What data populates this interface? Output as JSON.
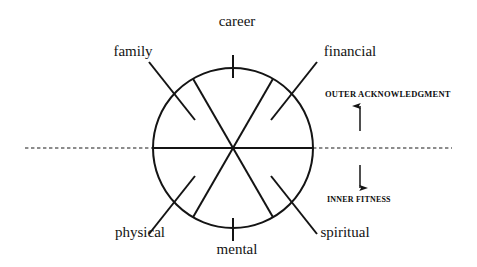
{
  "diagram": {
    "type": "radial-wheel",
    "stroke_color": "#141414",
    "background_color": "#ffffff",
    "circle": {
      "center_x": 233,
      "center_y": 148,
      "radius": 80
    },
    "sector_count": 6,
    "sector_labels": [
      {
        "id": "career",
        "text": "career",
        "angle_deg": 90,
        "position": "top",
        "x": 237,
        "y": 14,
        "tick": "vertical"
      },
      {
        "id": "family",
        "text": "family",
        "angle_deg": 150,
        "position": "upper-left",
        "x": 133,
        "y": 44,
        "tick": "diagonal"
      },
      {
        "id": "financial",
        "text": "financial",
        "angle_deg": 30,
        "position": "upper-right",
        "x": 350,
        "y": 44,
        "tick": "diagonal"
      },
      {
        "id": "physical",
        "text": "physical",
        "angle_deg": 210,
        "position": "lower-left",
        "x": 140,
        "y": 225,
        "tick": "diagonal"
      },
      {
        "id": "mental",
        "text": "mental",
        "angle_deg": 270,
        "position": "bottom",
        "x": 237,
        "y": 242,
        "tick": "vertical"
      },
      {
        "id": "spiritual",
        "text": "spiritual",
        "angle_deg": 330,
        "position": "lower-right",
        "x": 345,
        "y": 225,
        "tick": "diagonal"
      }
    ],
    "axis": {
      "divider_style": "dashed-horizontal",
      "divider_y": 148,
      "upper": {
        "id": "outer-acknowledgment",
        "text": "OUTER ACKNOWLEDGMENT",
        "x": 325,
        "y": 90,
        "arrow_direction": "up"
      },
      "lower": {
        "id": "inner-fitness",
        "text": "INNER FITNESS",
        "x": 327,
        "y": 196,
        "arrow_direction": "down"
      }
    }
  }
}
